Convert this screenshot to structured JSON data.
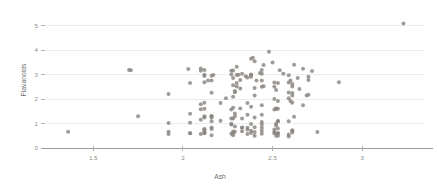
{
  "chart_data": {
    "type": "scatter",
    "title": "",
    "xlabel": "Ash",
    "ylabel": "Flavanoids",
    "xlim": [
      1.22,
      3.35
    ],
    "ylim": [
      0,
      5.35
    ],
    "xticks": [
      1.5,
      2,
      2.5,
      3
    ],
    "xtick_labels": [
      "1.5",
      "2",
      "2.5",
      "3"
    ],
    "yticks": [
      0,
      1,
      2,
      3,
      4,
      5
    ],
    "ytick_labels": [
      "0",
      "1",
      "2",
      "3",
      "4",
      "5"
    ],
    "grid": "horizontal",
    "legend": "none",
    "point_color": "#8a8580",
    "point_size": 2.0,
    "n_points": 178,
    "x": [
      2.43,
      2.14,
      2.67,
      2.5,
      2.87,
      2.45,
      2.45,
      2.61,
      2.17,
      2.27,
      2.3,
      2.32,
      2.41,
      2.39,
      2.38,
      2.7,
      2.72,
      2.62,
      2.48,
      2.56,
      2.28,
      2.65,
      2.36,
      2.52,
      2.61,
      2.51,
      2.12,
      2.59,
      2.29,
      2.1,
      2.44,
      2.12,
      2.4,
      2.27,
      2.04,
      2.44,
      2.33,
      2.38,
      2.16,
      2.53,
      2.61,
      2.51,
      2.31,
      2.12,
      2.59,
      2.29,
      2.1,
      2.44,
      2.12,
      2.4,
      2.7,
      2.35,
      2.3,
      2.28,
      2.03,
      2.32,
      2.64,
      2.38,
      2.54,
      2.3,
      1.36,
      2.28,
      1.7,
      2.16,
      2.53,
      1.92,
      2.16,
      2.53,
      2.28,
      2.36,
      2.52,
      2.61,
      2.51,
      2.12,
      2.59,
      1.71,
      2.21,
      2.75,
      2.28,
      2.32,
      1.75,
      2.21,
      2.67,
      2.24,
      2.6,
      2.3,
      2.69,
      2.62,
      2.28,
      2.27,
      2.4,
      2.36,
      2.52,
      2.61,
      2.51,
      2.12,
      2.59,
      2.29,
      2.1,
      2.44,
      2.12,
      2.4,
      2.27,
      2.04,
      2.44,
      2.33,
      2.38,
      2.16,
      2.53,
      1.92,
      2.16,
      2.53,
      2.28,
      2.36,
      2.52,
      2.61,
      2.51,
      2.12,
      2.59,
      2.29,
      2.1,
      2.44,
      2.12,
      2.4,
      2.27,
      2.04,
      2.44,
      2.33,
      2.38,
      2.16,
      2.53,
      1.92,
      2.16,
      2.53,
      2.28,
      2.36,
      2.52,
      2.61,
      2.51,
      2.12,
      2.59,
      2.29,
      2.1,
      2.44,
      2.12,
      2.4,
      2.27,
      2.04,
      2.44,
      2.33,
      2.38,
      2.16,
      2.53,
      1.92,
      2.16,
      2.53,
      2.28,
      2.36,
      2.52,
      2.61,
      2.51,
      2.12,
      2.59,
      2.29,
      2.1,
      2.44,
      2.12,
      2.4,
      2.27,
      2.04,
      2.44,
      2.33,
      2.38,
      2.16,
      3.23,
      2.38,
      2.7,
      2.6
    ],
    "y": [
      3.06,
      2.76,
      3.24,
      3.49,
      2.69,
      3.39,
      2.52,
      2.51,
      2.98,
      3.15,
      3.32,
      2.43,
      2.76,
      3.69,
      3.64,
      2.91,
      3.14,
      3.4,
      3.93,
      3.03,
      3.17,
      2.41,
      2.88,
      2.37,
      2.61,
      2.68,
      2.94,
      2.97,
      2.33,
      3.25,
      3.19,
      2.69,
      3.54,
      3.0,
      2.65,
      2.76,
      3.03,
      3.0,
      2.95,
      2.65,
      2.25,
      2.5,
      2.99,
      3.19,
      2.27,
      2.28,
      3.15,
      3.03,
      2.99,
      2.45,
      2.17,
      2.93,
      2.98,
      2.56,
      3.23,
      2.78,
      2.86,
      2.98,
      3.18,
      2.51,
      0.66,
      0.6,
      3.19,
      2.26,
      1.92,
      2.21,
      1.3,
      1.6,
      2.86,
      1.36,
      1.61,
      2.14,
      1.57,
      1.85,
      2.03,
      3.18,
      1.11,
      0.65,
      2.09,
      1.61,
      1.3,
      1.84,
      1.75,
      2.03,
      1.92,
      2.65,
      2.14,
      1.28,
      1.64,
      1.57,
      2.14,
      1.84,
      1.6,
      1.85,
      2.0,
      1.3,
      2.68,
      1.3,
      1.58,
      2.5,
      1.25,
      0.5,
      0.58,
      0.6,
      0.83,
      0.68,
      0.7,
      1.09,
      0.6,
      0.57,
      0.84,
      0.5,
      0.67,
      0.57,
      0.92,
      0.73,
      0.6,
      0.68,
      0.47,
      0.66,
      0.57,
      0.96,
      0.78,
      0.85,
      0.99,
      0.6,
      0.58,
      0.84,
      0.61,
      0.52,
      0.8,
      0.66,
      0.78,
      0.6,
      0.52,
      0.76,
      0.5,
      0.63,
      0.65,
      0.76,
      1.09,
      1.41,
      1.79,
      1.75,
      1.6,
      1.25,
      1.2,
      1.4,
      1.36,
      0.83,
      0.98,
      1.31,
      1.1,
      1.02,
      1.25,
      1.09,
      1.2,
      0.83,
      0.99,
      0.69,
      0.76,
      0.62,
      0.55,
      0.88,
      1.15,
      0.7,
      0.6,
      0.65,
      0.96,
      1.03,
      1.06,
      1.2,
      2.91,
      2.76,
      5.08,
      1.68,
      2.78,
      2.76
    ]
  }
}
